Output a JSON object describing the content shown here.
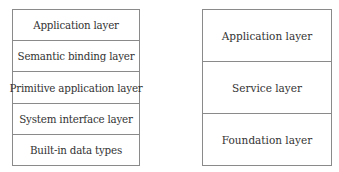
{
  "left_stack": {
    "layers": [
      {
        "label": "Application layer"
      },
      {
        "label": "Semantic binding layer"
      },
      {
        "label": "Primitive application layer"
      },
      {
        "label": "System interface layer"
      },
      {
        "label": "Built-in data types"
      }
    ]
  },
  "right_stack": {
    "layers": [
      {
        "label": "Application layer"
      },
      {
        "label": "Service layer"
      },
      {
        "label": "Foundation layer"
      }
    ]
  }
}
